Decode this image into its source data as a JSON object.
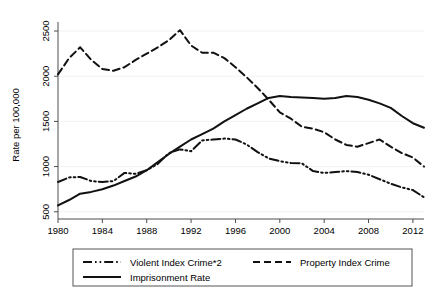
{
  "chart_data": {
    "type": "line",
    "title": "",
    "xlabel": "",
    "ylabel": "Rate per 100,000",
    "xlim": [
      1980,
      2013
    ],
    "ylim": [
      420,
      2600
    ],
    "grid": true,
    "legend_position": "bottom",
    "xticks": [
      1980,
      1984,
      1988,
      1992,
      1996,
      2000,
      2004,
      2008,
      2012
    ],
    "xtick_labels": [
      "1980",
      "1984",
      "1988",
      "1992",
      "1996",
      "2000",
      "2004",
      "2008",
      "2012"
    ],
    "yticks": [
      500,
      1000,
      1500,
      2000,
      2500
    ],
    "ytick_labels": [
      "500",
      "1000",
      "1500",
      "2000",
      "2500"
    ],
    "x": [
      1980,
      1981,
      1982,
      1983,
      1984,
      1985,
      1986,
      1987,
      1988,
      1989,
      1990,
      1991,
      1992,
      1993,
      1994,
      1995,
      1996,
      1997,
      1998,
      1999,
      2000,
      2001,
      2002,
      2003,
      2004,
      2005,
      2006,
      2007,
      2008,
      2009,
      2010,
      2011,
      2012,
      2013
    ],
    "series": [
      {
        "name": "Violent Index Crime*2",
        "style": "dash-dot",
        "color": "#111111",
        "values": [
          830,
          880,
          885,
          840,
          830,
          840,
          930,
          920,
          960,
          1030,
          1150,
          1190,
          1170,
          1290,
          1300,
          1310,
          1300,
          1245,
          1160,
          1090,
          1060,
          1040,
          1035,
          950,
          930,
          940,
          950,
          940,
          910,
          860,
          810,
          770,
          740,
          660
        ]
      },
      {
        "name": "Property Index Crime",
        "style": "dashed",
        "color": "#111111",
        "values": [
          2020,
          2200,
          2320,
          2180,
          2080,
          2060,
          2100,
          2180,
          2250,
          2320,
          2400,
          2510,
          2340,
          2260,
          2260,
          2200,
          2100,
          1990,
          1870,
          1740,
          1600,
          1530,
          1440,
          1420,
          1380,
          1300,
          1240,
          1220,
          1260,
          1300,
          1220,
          1150,
          1100,
          1000
        ]
      },
      {
        "name": "Imprisonment Rate",
        "style": "solid",
        "color": "#111111",
        "values": [
          570,
          630,
          700,
          720,
          750,
          790,
          840,
          890,
          960,
          1050,
          1140,
          1220,
          1300,
          1360,
          1420,
          1500,
          1570,
          1640,
          1700,
          1760,
          1780,
          1770,
          1765,
          1760,
          1750,
          1760,
          1780,
          1770,
          1740,
          1700,
          1650,
          1560,
          1480,
          1430
        ]
      }
    ],
    "legend_entries": [
      {
        "label": "Violent Index Crime*2",
        "style": "dash-dot"
      },
      {
        "label": "Property Index Crime",
        "style": "dashed"
      },
      {
        "label": "Imprisonment Rate",
        "style": "solid"
      }
    ]
  }
}
